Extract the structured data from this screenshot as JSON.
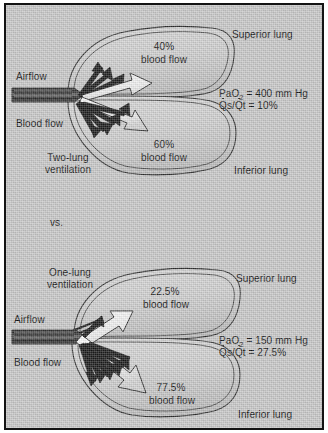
{
  "figure": {
    "comparison_separator": "vs.",
    "background_color": "#c9c9c9",
    "frame_color": "#141414",
    "ink_color": "#111111"
  },
  "panels": [
    {
      "id": "two-lung",
      "condition_label": "Two-lung\nventilation",
      "condition_line1": "Two-lung",
      "condition_line2": "ventilation",
      "airflow_label": "Airflow",
      "blood_flow_label": "Blood flow",
      "superior_lung_label": "Superior lung",
      "inferior_lung_label": "Inferior lung",
      "superior_flow_pct": "40%",
      "superior_flow_caption": "blood flow",
      "inferior_flow_pct": "60%",
      "inferior_flow_caption": "blood flow",
      "pao2_prefix": "PaO",
      "pao2_sub": "2",
      "pao2_value": " = 400 mm Hg",
      "shunt_prefix": "Q",
      "shunt_s": "s",
      "shunt_slash": "/",
      "shunt_q2": "Q",
      "shunt_t": "t",
      "shunt_value": " = 10%"
    },
    {
      "id": "one-lung",
      "condition_label": "One-lung\nventilation",
      "condition_line1": "One-lung",
      "condition_line2": "ventilation",
      "airflow_label": "Airflow",
      "blood_flow_label": "Blood flow",
      "superior_lung_label": "Superior lung",
      "inferior_lung_label": "Inferior lung",
      "superior_flow_pct": "22.5%",
      "superior_flow_caption": "blood flow",
      "inferior_flow_pct": "77.5%",
      "inferior_flow_caption": "blood flow",
      "pao2_prefix": "PaO",
      "pao2_sub": "2",
      "pao2_value": " = 150 mm Hg",
      "shunt_prefix": "Q",
      "shunt_s": "s",
      "shunt_slash": "/",
      "shunt_q2": "Q",
      "shunt_t": "t",
      "shunt_value": " = 27.5%"
    }
  ]
}
